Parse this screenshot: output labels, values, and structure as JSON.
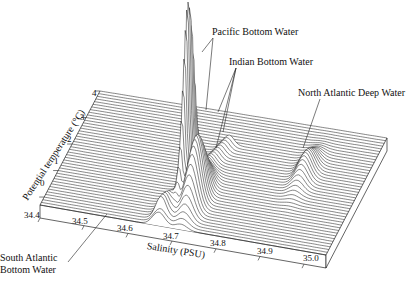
{
  "chart_data": {
    "type": "waterfall-3d",
    "title": "",
    "xlabel": "Salinity (PSU)",
    "ylabel": "Potential temperature (°C)",
    "x_ticks": [
      "34.4",
      "34.5",
      "34.6",
      "34.7",
      "34.8",
      "34.9",
      "35.0"
    ],
    "y_ticks": [
      "0",
      "1",
      "2",
      "3",
      "4"
    ],
    "xlim": [
      34.4,
      35.05
    ],
    "ylim": [
      -0.3,
      4
    ],
    "annotations": [
      {
        "text": "Pacific Bottom Water",
        "x": 34.69,
        "y": 1.1
      },
      {
        "text": "Indian Bottom Water",
        "x": 34.72,
        "y": 0.9
      },
      {
        "text": "North Atlantic Deep Water",
        "x": 34.91,
        "y": 2.5
      },
      {
        "text": "South Atlantic Bottom Water",
        "x": 34.68,
        "y": -0.1
      }
    ],
    "peaks": [
      {
        "name": "Pacific Bottom Water",
        "salinity": 34.69,
        "theta": 1.2,
        "height": 1.0
      },
      {
        "name": "Indian Bottom Water",
        "salinity": 34.72,
        "theta": 0.8,
        "height": 0.35
      },
      {
        "name": "North Atlantic Deep Water",
        "salinity": 34.92,
        "theta": 2.3,
        "height": 0.12
      },
      {
        "name": "South Atlantic Bottom Water",
        "salinity": 34.67,
        "theta": -0.1,
        "height": 0.08
      }
    ],
    "n_traces": 44
  },
  "labels": {
    "pacific": "Pacific Bottom Water",
    "indian": "Indian Bottom Water",
    "nadw": "North Atlantic Deep Water",
    "saabw_1": "South Atlantic",
    "saabw_2": "Bottom Water",
    "xlabel": "Salinity (PSU)",
    "ylabel": "Potential temperature (°C)"
  }
}
